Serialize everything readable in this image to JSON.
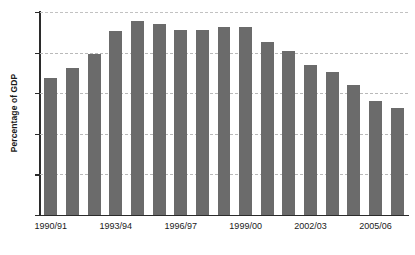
{
  "chart_data": {
    "type": "bar",
    "title": "",
    "xlabel": "",
    "ylabel": "Percentage of GDP",
    "ylim": [
      0,
      15
    ],
    "yticks": [
      0,
      3,
      6,
      9,
      12,
      15
    ],
    "ytick_labels": [
      "0",
      "3",
      "6",
      "9",
      "12",
      "15"
    ],
    "grid": true,
    "grid_style": "dashed-horizontal",
    "legend": "none",
    "bar_color": "#6b6b6b",
    "axis_color": "#2b2b2b",
    "gridline_color": "#b9b9b9",
    "categories": [
      "1990/91",
      "1991/92",
      "1992/93",
      "1993/94",
      "1994/95",
      "1995/96",
      "1996/97",
      "1997/98",
      "1998/99",
      "1999/00",
      "2000/01",
      "2001/02",
      "2002/03",
      "2003/04",
      "2004/05",
      "2005/06",
      "2006/07"
    ],
    "visible_xtick_labels": [
      {
        "category": "1990/91",
        "index": 0
      },
      {
        "category": "1993/94",
        "index": 3
      },
      {
        "category": "1996/97",
        "index": 6
      },
      {
        "category": "1999/00",
        "index": 9
      },
      {
        "category": "2002/03",
        "index": 12
      },
      {
        "category": "2005/06",
        "index": 15
      }
    ],
    "values": [
      10.1,
      10.9,
      11.9,
      13.6,
      14.3,
      14.1,
      13.7,
      13.7,
      13.9,
      13.9,
      12.8,
      12.1,
      11.1,
      10.6,
      9.6,
      8.4,
      7.9
    ]
  }
}
